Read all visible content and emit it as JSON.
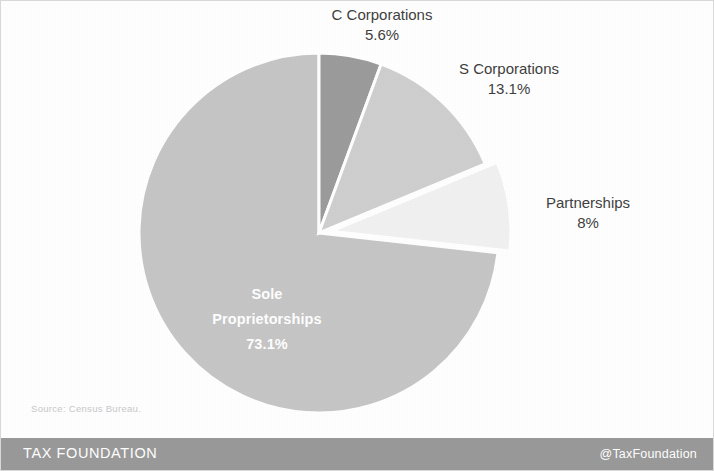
{
  "chart_data": {
    "type": "pie",
    "title": "",
    "subtitle": "",
    "legend_position": "callout-labels",
    "categories": [
      "C Corporations",
      "S Corporations",
      "Partnerships",
      "Sole Proprietorships"
    ],
    "values": [
      5.6,
      13.1,
      8,
      73.1
    ],
    "value_labels": [
      "5.6%",
      "13.1%",
      "8%",
      "73.1%"
    ],
    "colors": [
      "#9c9c9c",
      "#cfcfcf",
      "#f1f1f1",
      "#c6c6c6"
    ],
    "start_angle_deg": 0,
    "direction": "clockwise",
    "exploded_slices": [
      "Partnerships"
    ],
    "slice_border_color": "#ffffff",
    "units": "percent",
    "total": 100
  },
  "labels": {
    "ccorp": {
      "name": "C Corporations",
      "value": "5.6%"
    },
    "scorp": {
      "name": "S Corporations",
      "value": "13.1%"
    },
    "partnerships": {
      "name": "Partnerships",
      "value": "8%"
    },
    "sole": {
      "name_line1": "Sole",
      "name_line2": "Proprietorships",
      "value": "73.1%"
    }
  },
  "source": {
    "text": "Source: Census Bureau."
  },
  "footer": {
    "brand": "TAX FOUNDATION",
    "handle": "@TaxFoundation",
    "background_color": "#9a9a9a",
    "text_color": "#ffffff"
  }
}
